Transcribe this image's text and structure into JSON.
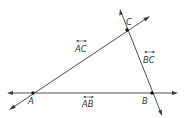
{
  "diagram": {
    "colors": {
      "line": "#3a3a3a",
      "point": "#1a1a1a",
      "text": "#333333",
      "background": "#ffffff"
    },
    "points": [
      {
        "id": "A",
        "label": "A",
        "x": 33,
        "y": 93
      },
      {
        "id": "B",
        "label": "B",
        "x": 152,
        "y": 93
      },
      {
        "id": "C",
        "label": "C",
        "x": 127,
        "y": 30
      }
    ],
    "lines": [
      {
        "id": "AB",
        "label": "AB",
        "notation": "line-overarrow",
        "from": [
          8,
          93
        ],
        "to": [
          177,
          93
        ]
      },
      {
        "id": "AC",
        "label": "AC",
        "notation": "line-overarrow",
        "from": [
          10,
          109
        ],
        "to": [
          149,
          17
        ]
      },
      {
        "id": "BC",
        "label": "BC",
        "notation": "line-overarrow",
        "from": [
          120,
          10
        ],
        "to": [
          162,
          115
        ]
      }
    ],
    "labels": {
      "point_a": "A",
      "point_b": "B",
      "point_c": "C",
      "line_ab": "AB",
      "line_ac": "AC",
      "line_bc": "BC"
    }
  }
}
